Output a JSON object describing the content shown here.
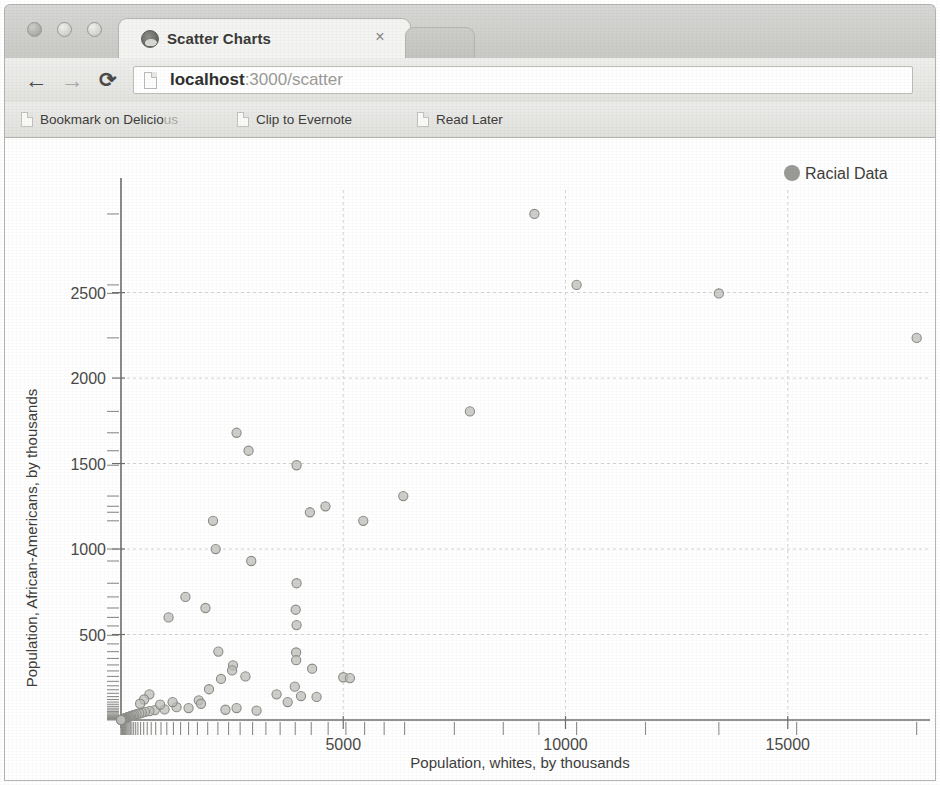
{
  "window": {
    "traffic_lights": [
      "close",
      "minimize",
      "maximize"
    ]
  },
  "tabs": {
    "active": {
      "title": "Scatter Charts",
      "favicon": "globe-icon",
      "close": "×"
    },
    "inactive_label": ""
  },
  "toolbar": {
    "back": "←",
    "forward": "→",
    "reload": "⟳",
    "url_host": "localhost",
    "url_rest": ":3000/scatter",
    "url_full": "localhost:3000/scatter",
    "page_icon": "page-icon"
  },
  "bookmarks": [
    {
      "label": "Bookmark on Delicio",
      "tail": "us",
      "icon": "page-icon"
    },
    {
      "label": "Clip to Evernote",
      "tail": "",
      "icon": "page-icon"
    },
    {
      "label": "Read Later",
      "tail": "",
      "icon": "page-icon"
    }
  ],
  "legend": {
    "label": "Racial Data",
    "marker_color": "#9a9a97"
  },
  "colors": {
    "point_fill": "#bdbdba",
    "point_stroke": "#8d8d8a",
    "grid": "#d3d3d0",
    "axis": "#6f6f6d",
    "chrome_bg": "#d7d7d5"
  },
  "chart_data": {
    "type": "scatter",
    "title": "",
    "xlabel": "Population, whites, by thousands",
    "ylabel": "Population, African-Americans, by thousands",
    "xlim": [
      0,
      18200
    ],
    "ylim": [
      0,
      3100
    ],
    "xticks": [
      5000,
      10000,
      15000
    ],
    "xtick_labels": [
      "5000",
      "10000",
      "15000"
    ],
    "yticks": [
      500,
      1000,
      1500,
      2000,
      2500
    ],
    "ytick_labels": [
      "500",
      "1000",
      "1500",
      "2000",
      "2500"
    ],
    "grid": true,
    "legend_position": "top-right",
    "series": [
      {
        "name": "Racial Data",
        "points": [
          [
            9300,
            2960
          ],
          [
            10250,
            2545
          ],
          [
            13450,
            2495
          ],
          [
            17900,
            2235
          ],
          [
            7850,
            1805
          ],
          [
            2600,
            1680
          ],
          [
            2870,
            1575
          ],
          [
            3950,
            1490
          ],
          [
            6350,
            1310
          ],
          [
            5450,
            1165
          ],
          [
            2070,
            1165
          ],
          [
            4250,
            1215
          ],
          [
            4600,
            1250
          ],
          [
            2130,
            1000
          ],
          [
            2930,
            930
          ],
          [
            3950,
            800
          ],
          [
            1450,
            720
          ],
          [
            1900,
            655
          ],
          [
            1070,
            600
          ],
          [
            3930,
            645
          ],
          [
            3950,
            555
          ],
          [
            2190,
            400
          ],
          [
            3940,
            395
          ],
          [
            3940,
            350
          ],
          [
            2520,
            320
          ],
          [
            2500,
            290
          ],
          [
            4300,
            300
          ],
          [
            2800,
            255
          ],
          [
            5000,
            250
          ],
          [
            5150,
            245
          ],
          [
            3910,
            195
          ],
          [
            2250,
            240
          ],
          [
            1980,
            180
          ],
          [
            3500,
            150
          ],
          [
            4050,
            140
          ],
          [
            4400,
            135
          ],
          [
            3750,
            105
          ],
          [
            1750,
            115
          ],
          [
            1800,
            95
          ],
          [
            1250,
            75
          ],
          [
            1520,
            70
          ],
          [
            980,
            62
          ],
          [
            760,
            58
          ],
          [
            640,
            52
          ],
          [
            540,
            48
          ],
          [
            470,
            42
          ],
          [
            410,
            38
          ],
          [
            350,
            34
          ],
          [
            300,
            30
          ],
          [
            265,
            27
          ],
          [
            230,
            24
          ],
          [
            200,
            21
          ],
          [
            175,
            18
          ],
          [
            150,
            16
          ],
          [
            128,
            14
          ],
          [
            110,
            12
          ],
          [
            95,
            10
          ],
          [
            80,
            9
          ],
          [
            68,
            8
          ],
          [
            56,
            7
          ],
          [
            46,
            6
          ],
          [
            38,
            5
          ],
          [
            30,
            4
          ],
          [
            24,
            3.5
          ],
          [
            19,
            3
          ],
          [
            15,
            2.5
          ],
          [
            11,
            2
          ],
          [
            8,
            1.6
          ],
          [
            6,
            1.2
          ],
          [
            4,
            0.9
          ],
          [
            2.5,
            0.6
          ],
          [
            1.5,
            0.4
          ],
          [
            880,
            90
          ],
          [
            1160,
            105
          ],
          [
            2350,
            60
          ],
          [
            2600,
            70
          ],
          [
            3050,
            55
          ],
          [
            640,
            150
          ],
          [
            520,
            120
          ],
          [
            430,
            95
          ]
        ]
      }
    ],
    "x_rug_values": [
      2,
      5,
      9,
      14,
      20,
      27,
      35,
      44,
      55,
      68,
      82,
      98,
      116,
      136,
      158,
      182,
      210,
      245,
      285,
      330,
      380,
      440,
      510,
      590,
      680,
      780,
      900,
      1030,
      1180,
      1340,
      1520,
      1720,
      1950,
      2180,
      2420,
      2680,
      2960,
      3260,
      3580,
      3920,
      4280,
      4660,
      5060,
      5480,
      5920,
      6380,
      7500,
      8600,
      9400,
      10250,
      11800,
      13450,
      15200,
      17900
    ],
    "y_rug_values": [
      1,
      2,
      3,
      5,
      7,
      9,
      12,
      15,
      19,
      24,
      29,
      35,
      42,
      50,
      59,
      69,
      80,
      92,
      105,
      120,
      137,
      156,
      177,
      200,
      226,
      255,
      287,
      322,
      360,
      400,
      445,
      495,
      550,
      600,
      655,
      720,
      800,
      930,
      1000,
      1165,
      1215,
      1250,
      1310,
      1490,
      1575,
      1680,
      1805,
      2235,
      2495,
      2545,
      2960
    ]
  }
}
